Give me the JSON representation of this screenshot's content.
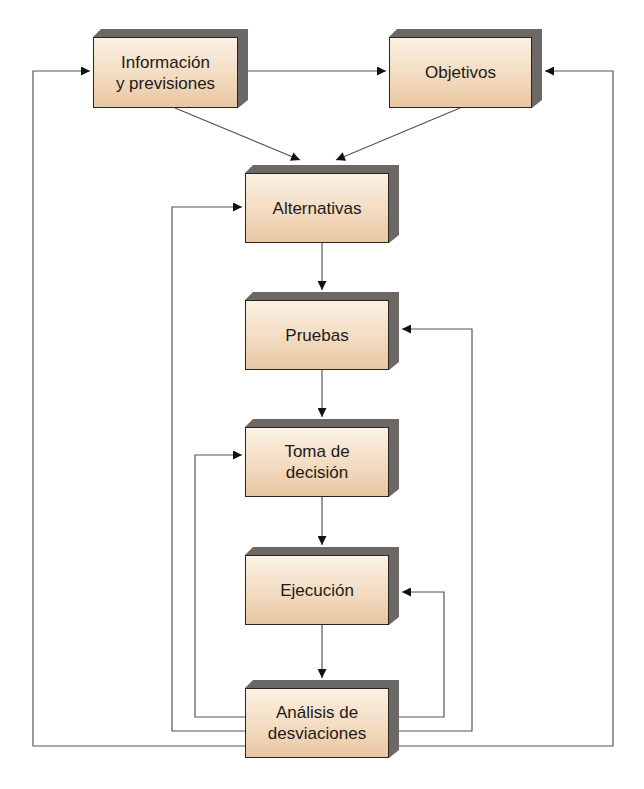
{
  "diagram": {
    "colors": {
      "box_fill_top": "#fbf1e4",
      "box_fill_bottom": "#e8c6a2",
      "box_border": "#2a2421",
      "shadow": "#6b6866",
      "line": "#555555",
      "arrowhead": "#111111"
    },
    "nodes": [
      {
        "id": "informacion",
        "label": "Información\ny previsiones"
      },
      {
        "id": "objetivos",
        "label": "Objetivos"
      },
      {
        "id": "alternativas",
        "label": "Alternativas"
      },
      {
        "id": "pruebas",
        "label": "Pruebas"
      },
      {
        "id": "toma",
        "label": "Toma de\ndecisión"
      },
      {
        "id": "ejecucion",
        "label": "Ejecución"
      },
      {
        "id": "analisis",
        "label": "Análisis de\ndesviaciones"
      }
    ],
    "edges": [
      {
        "from": "informacion",
        "to": "objetivos"
      },
      {
        "from": "informacion",
        "to": "alternativas"
      },
      {
        "from": "objetivos",
        "to": "alternativas"
      },
      {
        "from": "alternativas",
        "to": "pruebas"
      },
      {
        "from": "pruebas",
        "to": "toma"
      },
      {
        "from": "toma",
        "to": "ejecucion"
      },
      {
        "from": "ejecucion",
        "to": "analisis"
      },
      {
        "from": "analisis",
        "to": "informacion",
        "type": "feedback"
      },
      {
        "from": "analisis",
        "to": "objetivos",
        "type": "feedback"
      },
      {
        "from": "analisis",
        "to": "alternativas",
        "type": "feedback"
      },
      {
        "from": "analisis",
        "to": "pruebas",
        "type": "feedback"
      },
      {
        "from": "analisis",
        "to": "toma",
        "type": "feedback"
      },
      {
        "from": "analisis",
        "to": "ejecucion",
        "type": "feedback"
      }
    ]
  }
}
